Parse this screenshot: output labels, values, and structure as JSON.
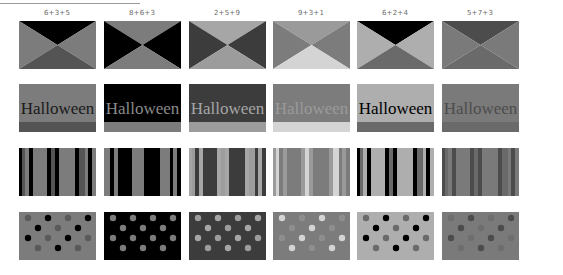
{
  "columns": [
    {
      "label": "6+3+5",
      "c1": "#000000",
      "c2": "#7c7c7c",
      "c3": "#545454",
      "hw_bg": "#7c7c7c",
      "hw_text": "#1a1a1a",
      "hw_band": "#545454",
      "dot_bg": "#7c7c7c",
      "dot_a": "#5a5a5a",
      "dot_b": "#000000"
    },
    {
      "label": "8+6+3",
      "c1": "#7c7c7c",
      "c2": "#000000",
      "c3": "#7c7c7c",
      "hw_bg": "#000000",
      "hw_text": "#8a8a8a",
      "hw_band": "#7c7c7c",
      "dot_bg": "#000000",
      "dot_a": "#7c7c7c",
      "dot_b": "#7c7c7c"
    },
    {
      "label": "2+5+9",
      "c1": "#a6a6a6",
      "c2": "#3c3c3c",
      "c3": "#9c9c9c",
      "hw_bg": "#3c3c3c",
      "hw_text": "#a6a6a6",
      "hw_band": "#9c9c9c",
      "dot_bg": "#3c3c3c",
      "dot_a": "#9c9c9c",
      "dot_b": "#a6a6a6"
    },
    {
      "label": "9+3+1",
      "c1": "#9a9a9a",
      "c2": "#7c7c7c",
      "c3": "#d4d4d4",
      "hw_bg": "#7c7c7c",
      "hw_text": "#9a9a9a",
      "hw_band": "#d4d4d4",
      "dot_bg": "#7c7c7c",
      "dot_a": "#d4d4d4",
      "dot_b": "#8e8e8e"
    },
    {
      "label": "6+2+4",
      "c1": "#000000",
      "c2": "#aeaeae",
      "c3": "#6a6a6a",
      "hw_bg": "#aeaeae",
      "hw_text": "#000000",
      "hw_band": "#6a6a6a",
      "dot_bg": "#aeaeae",
      "dot_a": "#6a6a6a",
      "dot_b": "#000000"
    },
    {
      "label": "5+7+3",
      "c1": "#4c4c4c",
      "c2": "#7a7a7a",
      "c3": "#6a6a6a",
      "hw_bg": "#7a7a7a",
      "hw_text": "#4c4c4c",
      "hw_band": "#6a6a6a",
      "dot_bg": "#7a7a7a",
      "dot_a": "#6e6e6e",
      "dot_b": "#4c4c4c"
    }
  ],
  "halloween_word": "Halloween",
  "layout": {
    "col_x": [
      19,
      104,
      189,
      273,
      357,
      442
    ],
    "row_y": [
      21,
      84,
      148,
      212
    ]
  }
}
